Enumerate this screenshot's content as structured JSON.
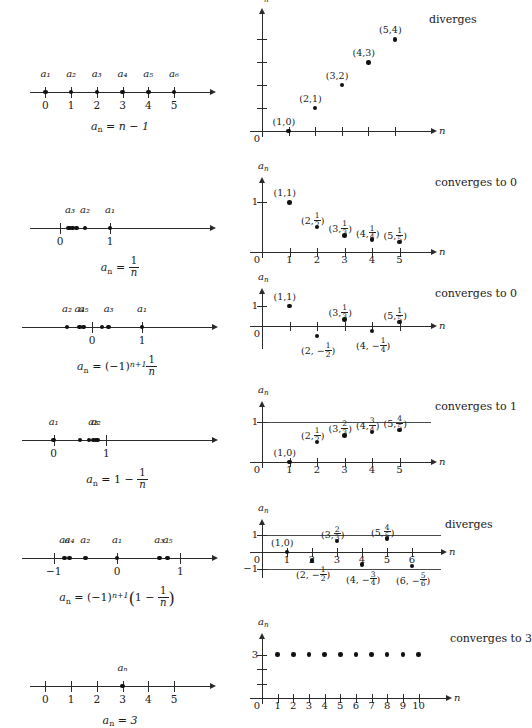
{
  "figure": {
    "axis_labels": {
      "y": "a",
      "y_sub": "n",
      "x": "n"
    }
  },
  "rows": [
    {
      "id": "row-1",
      "formula_parts": {
        "lhs": "a",
        "lhs_sub": "n",
        "eq": "=",
        "rhs": "n − 1"
      },
      "verdict": "diverges",
      "numberline": {
        "ticks": [
          "0",
          "1",
          "2",
          "3",
          "4",
          "5"
        ],
        "point_labels": [
          "a₁",
          "a₂",
          "a₃",
          "a₄",
          "a₅",
          "a₆"
        ],
        "point_values": [
          0,
          1,
          2,
          3,
          4,
          5
        ],
        "range": [
          -0.6,
          6.4
        ]
      },
      "plot": {
        "points": [
          {
            "x": 1,
            "y": 0,
            "label": "(1,0)"
          },
          {
            "x": 2,
            "y": 1,
            "label": "(2,1)"
          },
          {
            "x": 3,
            "y": 2,
            "label": "(3,2)"
          },
          {
            "x": 4,
            "y": 3,
            "label": "(4,3)"
          },
          {
            "x": 5,
            "y": 4,
            "label": "(5,4)"
          }
        ],
        "xticks": [
          1,
          2,
          3,
          4,
          5
        ],
        "xtick_labels": [
          "",
          "",
          "",
          "",
          ""
        ],
        "yticks": [
          1,
          2,
          3,
          4
        ],
        "ytick_labels": [
          "",
          "",
          "",
          ""
        ],
        "origin_label": "0",
        "xlim": [
          0,
          6.2
        ],
        "ylim": [
          0,
          4.8
        ]
      }
    },
    {
      "id": "row-2",
      "formula_parts": {
        "lhs": "a",
        "lhs_sub": "n",
        "eq": "=",
        "frac_num": "1",
        "frac_den": "n"
      },
      "verdict": "converges to 0",
      "numberline": {
        "ticks": [
          "0",
          "1"
        ],
        "tick_values": [
          0,
          1
        ],
        "point_labels": [
          "a₃",
          "a₂",
          "a₁"
        ],
        "point_values": [
          0.167,
          0.2,
          0.25,
          0.333,
          0.5,
          1
        ],
        "range": [
          -0.6,
          3.0
        ]
      },
      "plot": {
        "points": [
          {
            "x": 1,
            "y": 1,
            "label": "(1,1)"
          },
          {
            "x": 2,
            "y": 0.5,
            "label": "(2,½)"
          },
          {
            "x": 3,
            "y": 0.3333,
            "label": "(3,⅓)"
          },
          {
            "x": 4,
            "y": 0.25,
            "label": "(4,¼)"
          },
          {
            "x": 5,
            "y": 0.2,
            "label": "(5,⅕)"
          }
        ],
        "xticks": [
          1,
          2,
          3,
          4,
          5
        ],
        "xtick_labels": [
          "1",
          "2",
          "3",
          "4",
          "5"
        ],
        "yticks": [
          1
        ],
        "ytick_labels": [
          "1"
        ],
        "origin_label": "0",
        "xlim": [
          0,
          6.0
        ],
        "ylim": [
          0,
          1.25
        ]
      }
    },
    {
      "id": "row-3",
      "formula_parts": {
        "lhs": "a",
        "lhs_sub": "n",
        "eq": "=",
        "base": "(−1)",
        "exp": "n+1",
        "frac_num": "1",
        "frac_den": "n"
      },
      "verdict": "converges to 0",
      "numberline": {
        "ticks": [
          "0",
          "1"
        ],
        "tick_values": [
          0,
          1
        ],
        "point_labels": [
          "a₂",
          "a₄",
          "a₅",
          "a₃",
          "a₁"
        ],
        "point_values": [
          -0.5,
          -0.25,
          -0.167,
          0.2,
          0.333,
          1
        ],
        "range": [
          -1.4,
          2.4
        ]
      },
      "plot": {
        "points": [
          {
            "x": 1,
            "y": 1,
            "label": "(1,1)"
          },
          {
            "x": 2,
            "y": -0.5,
            "label": "(2, −½)"
          },
          {
            "x": 3,
            "y": 0.3333,
            "label": "(3,⅓)"
          },
          {
            "x": 4,
            "y": -0.25,
            "label": "(4, −¼)"
          },
          {
            "x": 5,
            "y": 0.2,
            "label": "(5,⅕)"
          }
        ],
        "xticks": [
          1,
          2,
          3,
          4,
          5
        ],
        "xtick_labels": [
          "",
          "",
          "",
          "",
          ""
        ],
        "yticks": [
          1
        ],
        "ytick_labels": [
          "1"
        ],
        "origin_label": "0",
        "xlim": [
          0,
          6.0
        ],
        "ylim": [
          -0.85,
          1.25
        ]
      }
    },
    {
      "id": "row-4",
      "formula_parts": {
        "lhs": "a",
        "lhs_sub": "n",
        "eq": "=",
        "one": "1 −",
        "frac_num": "1",
        "frac_den": "n"
      },
      "verdict": "converges to 1",
      "numberline": {
        "ticks": [
          "0",
          "1"
        ],
        "tick_values": [
          0,
          1
        ],
        "point_labels": [
          "a₁",
          "a₂",
          "a₃"
        ],
        "point_values": [
          0,
          0.5,
          0.667,
          0.75,
          0.8,
          0.833
        ],
        "range": [
          -0.6,
          3.0
        ]
      },
      "plot": {
        "points": [
          {
            "x": 1,
            "y": 0,
            "label": "(1,0)"
          },
          {
            "x": 2,
            "y": 0.5,
            "label": "(2,½)"
          },
          {
            "x": 3,
            "y": 0.6667,
            "label": "(3,⅔)"
          },
          {
            "x": 4,
            "y": 0.75,
            "label": "(4,¾)"
          },
          {
            "x": 5,
            "y": 0.8,
            "label": "(5,⅘)"
          }
        ],
        "xticks": [
          1,
          2,
          3,
          4,
          5
        ],
        "xtick_labels": [
          "1",
          "2",
          "3",
          "4",
          "5"
        ],
        "yticks": [
          1
        ],
        "ytick_labels": [
          "1"
        ],
        "origin_label": "0",
        "asymptote": 1,
        "xlim": [
          0,
          6.0
        ],
        "ylim": [
          0,
          1.2
        ]
      }
    },
    {
      "id": "row-5",
      "formula_parts": {
        "lhs": "a",
        "lhs_sub": "n",
        "eq": "=",
        "base": "(−1)",
        "exp": "n+1",
        "inner": "1 −",
        "frac_num": "1",
        "frac_den": "n"
      },
      "verdict": "diverges",
      "numberline": {
        "ticks": [
          "−1",
          "0",
          "1"
        ],
        "tick_values": [
          -1,
          0,
          1
        ],
        "point_labels": [
          "a₆",
          "a₄",
          "a₂",
          "a₁",
          "a₃",
          "a₅"
        ],
        "point_values": [
          -0.833,
          -0.75,
          -0.5,
          0,
          0.667,
          0.8
        ],
        "range": [
          -1.5,
          1.5
        ]
      },
      "plot": {
        "points": [
          {
            "x": 1,
            "y": 0,
            "label": "(1,0)"
          },
          {
            "x": 2,
            "y": -0.5,
            "label": "(2, −½)"
          },
          {
            "x": 3,
            "y": 0.6667,
            "label": "(3,⅔)"
          },
          {
            "x": 4,
            "y": -0.75,
            "label": "(4, −¾)"
          },
          {
            "x": 5,
            "y": 0.8,
            "label": "(5,⅘)"
          },
          {
            "x": 6,
            "y": -0.8333,
            "label": "(6, −⅚)"
          }
        ],
        "xticks": [
          1,
          2,
          3,
          4,
          5,
          6
        ],
        "xtick_labels": [
          "1",
          "2",
          "3",
          "4",
          "5",
          "6"
        ],
        "yticks": [
          1,
          -1
        ],
        "ytick_labels": [
          "1",
          "−1"
        ],
        "origin_label": "0",
        "asymptote": 1,
        "asymptote_neg": -1,
        "xlim": [
          0,
          7.0
        ],
        "ylim": [
          -1.2,
          1.2
        ]
      }
    },
    {
      "id": "row-6",
      "formula_parts": {
        "lhs": "a",
        "lhs_sub": "n",
        "eq": "=",
        "rhs": "3"
      },
      "verdict": "converges to 3",
      "numberline": {
        "ticks": [
          "0",
          "1",
          "2",
          "3",
          "4",
          "5"
        ],
        "tick_values": [
          0,
          1,
          2,
          3,
          4,
          5
        ],
        "point_labels": [
          "aₙ"
        ],
        "point_values": [
          3
        ],
        "range": [
          -0.6,
          6.4
        ]
      },
      "plot": {
        "points": [
          {
            "x": 1,
            "y": 3
          },
          {
            "x": 2,
            "y": 3
          },
          {
            "x": 3,
            "y": 3
          },
          {
            "x": 4,
            "y": 3
          },
          {
            "x": 5,
            "y": 3
          },
          {
            "x": 6,
            "y": 3
          },
          {
            "x": 7,
            "y": 3
          },
          {
            "x": 8,
            "y": 3
          },
          {
            "x": 9,
            "y": 3
          },
          {
            "x": 10,
            "y": 3
          }
        ],
        "xticks": [
          1,
          2,
          3,
          4,
          5,
          6,
          7,
          8,
          9,
          10
        ],
        "xtick_labels": [
          "1",
          "2",
          "3",
          "4",
          "5",
          "6",
          "7",
          "8",
          "9",
          "10"
        ],
        "yticks": [
          1,
          2,
          3
        ],
        "ytick_labels": [
          "",
          "",
          "3"
        ],
        "origin_label": "0",
        "xlim": [
          0,
          11.5
        ],
        "ylim": [
          0,
          3.6
        ]
      }
    }
  ]
}
